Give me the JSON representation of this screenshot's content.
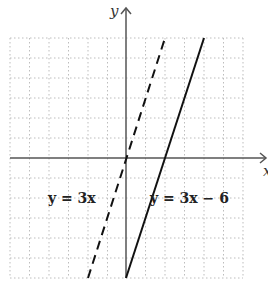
{
  "axes": {
    "x_label": "x",
    "y_label": "y",
    "x_range": [
      -6,
      6
    ],
    "y_range": [
      -6,
      6
    ],
    "grid": true,
    "grid_style": "dotted"
  },
  "lines": [
    {
      "label": "y = 3x",
      "equation": "y = 3x",
      "slope": 3,
      "intercept": 0,
      "style": "dashed",
      "x_span": [
        -2,
        2
      ]
    },
    {
      "label": "y = 3x − 6",
      "equation": "y = 3x - 6",
      "slope": 3,
      "intercept": -6,
      "style": "solid",
      "x_span": [
        0,
        4
      ]
    }
  ],
  "colors": {
    "axis": "#555555",
    "grid": "#bbbbbb",
    "line": "#111111"
  }
}
